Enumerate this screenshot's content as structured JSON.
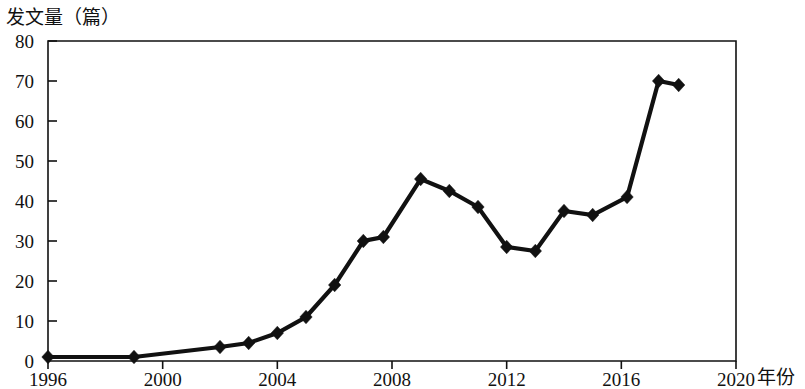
{
  "chart_data": {
    "type": "line",
    "title": "",
    "ylabel": "发文量（篇）",
    "xlabel": "年份",
    "xlim": [
      1996,
      2020
    ],
    "ylim": [
      0,
      80
    ],
    "grid": false,
    "legend": null,
    "x_ticks": [
      "1996",
      "2000",
      "2004",
      "2008",
      "2012",
      "2016",
      "2020"
    ],
    "x_tick_values": [
      1996,
      2000,
      2004,
      2008,
      2012,
      2016,
      2020
    ],
    "y_ticks": [
      "0",
      "10",
      "20",
      "30",
      "40",
      "50",
      "60",
      "70",
      "80"
    ],
    "y_tick_values": [
      0,
      10,
      20,
      30,
      40,
      50,
      60,
      70,
      80
    ],
    "x": [
      1996,
      1999,
      2002,
      2003,
      2004,
      2005,
      2006,
      2007,
      2009,
      2010,
      2011,
      2012,
      2013,
      2014,
      2015,
      2016,
      2017,
      2018
    ],
    "values": [
      1,
      1,
      3.5,
      4.5,
      7,
      11,
      19,
      30,
      45.5,
      42.5,
      38.5,
      28.5,
      27.5,
      37.5,
      36.5,
      41,
      70,
      69
    ],
    "series": [
      {
        "name": "发文量",
        "marker": "diamond",
        "color": "#111111",
        "points": [
          {
            "x": 1996,
            "y": 1
          },
          {
            "x": 1999,
            "y": 1
          },
          {
            "x": 2002,
            "y": 3.5
          },
          {
            "x": 2003,
            "y": 4.5
          },
          {
            "x": 2004,
            "y": 7
          },
          {
            "x": 2005,
            "y": 11
          },
          {
            "x": 2006,
            "y": 19
          },
          {
            "x": 2007,
            "y": 30
          },
          {
            "x": 2007.7,
            "y": 31
          },
          {
            "x": 2009,
            "y": 45.5
          },
          {
            "x": 2010,
            "y": 42.5
          },
          {
            "x": 2011,
            "y": 38.5
          },
          {
            "x": 2012,
            "y": 28.5
          },
          {
            "x": 2013,
            "y": 27.5
          },
          {
            "x": 2014,
            "y": 37.5
          },
          {
            "x": 2015,
            "y": 36.5
          },
          {
            "x": 2016.2,
            "y": 41
          },
          {
            "x": 2017.3,
            "y": 70
          },
          {
            "x": 2018,
            "y": 69
          }
        ]
      }
    ]
  },
  "axis_labels": {
    "y_axis_caption": "发文量（篇）",
    "x_axis_caption": "年份"
  }
}
